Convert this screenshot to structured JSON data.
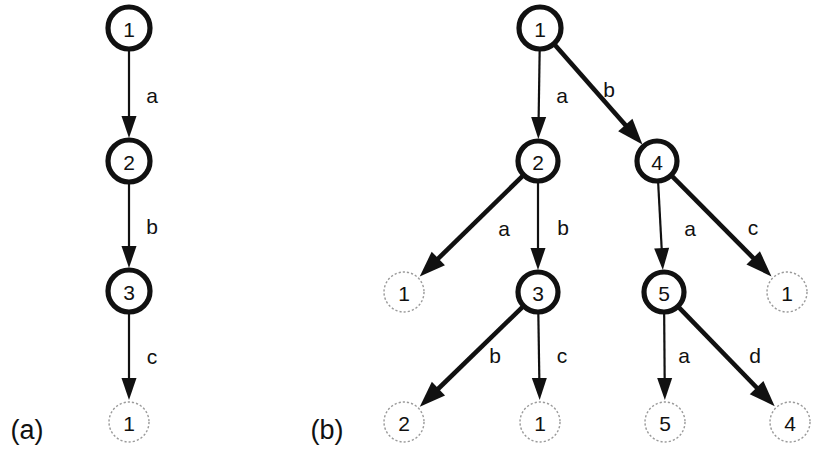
{
  "figure": {
    "width": 833,
    "height": 452,
    "background": "#ffffff",
    "stroke_color": "#111111",
    "dotted_node_color": "#9a9a9a"
  },
  "panels": [
    {
      "id": "a",
      "caption": "(a)",
      "caption_x": 27,
      "caption_y": 430,
      "nodes": [
        {
          "id": "a-n1",
          "label": "1",
          "x": 129,
          "y": 28,
          "r": 21,
          "style": "solid"
        },
        {
          "id": "a-n2",
          "label": "2",
          "x": 129,
          "y": 161,
          "r": 21,
          "style": "solid"
        },
        {
          "id": "a-n3",
          "label": "3",
          "x": 129,
          "y": 291,
          "r": 21,
          "style": "solid"
        },
        {
          "id": "a-n4",
          "label": "1",
          "x": 129,
          "y": 422,
          "r": 20,
          "style": "dotted"
        }
      ],
      "edges": [
        {
          "id": "a-e1",
          "from": "a-n1",
          "to": "a-n2",
          "label": "a",
          "label_x": 152,
          "label_y": 95,
          "weight": "thin"
        },
        {
          "id": "a-e2",
          "from": "a-n2",
          "to": "a-n3",
          "label": "b",
          "label_x": 152,
          "label_y": 226,
          "weight": "thin"
        },
        {
          "id": "a-e3",
          "from": "a-n3",
          "to": "a-n4",
          "label": "c",
          "label_x": 152,
          "label_y": 356,
          "weight": "thin"
        }
      ]
    },
    {
      "id": "b",
      "caption": "(b)",
      "caption_x": 327,
      "caption_y": 430,
      "nodes": [
        {
          "id": "b-n1",
          "label": "1",
          "x": 540,
          "y": 28,
          "r": 21,
          "style": "solid"
        },
        {
          "id": "b-n2",
          "label": "2",
          "x": 538,
          "y": 161,
          "r": 20,
          "style": "solid"
        },
        {
          "id": "b-n4",
          "label": "4",
          "x": 657,
          "y": 161,
          "r": 20,
          "style": "solid"
        },
        {
          "id": "b-l1",
          "label": "1",
          "x": 404,
          "y": 292,
          "r": 20,
          "style": "dotted"
        },
        {
          "id": "b-n3",
          "label": "3",
          "x": 538,
          "y": 292,
          "r": 20,
          "style": "solid"
        },
        {
          "id": "b-n5",
          "label": "5",
          "x": 664,
          "y": 292,
          "r": 20,
          "style": "solid"
        },
        {
          "id": "b-l2",
          "label": "1",
          "x": 787,
          "y": 292,
          "r": 20,
          "style": "dotted"
        },
        {
          "id": "b-l3",
          "label": "2",
          "x": 404,
          "y": 422,
          "r": 20,
          "style": "dotted"
        },
        {
          "id": "b-l4",
          "label": "1",
          "x": 540,
          "y": 422,
          "r": 20,
          "style": "dotted"
        },
        {
          "id": "b-l5",
          "label": "5",
          "x": 665,
          "y": 422,
          "r": 20,
          "style": "dotted"
        },
        {
          "id": "b-l6",
          "label": "4",
          "x": 790,
          "y": 422,
          "r": 20,
          "style": "dotted"
        }
      ],
      "edges": [
        {
          "id": "b-e1",
          "from": "b-n1",
          "to": "b-n2",
          "label": "a",
          "label_x": 562,
          "label_y": 95,
          "weight": "thin"
        },
        {
          "id": "b-e2",
          "from": "b-n1",
          "to": "b-n4",
          "label": "b",
          "label_x": 609,
          "label_y": 89,
          "weight": "thick"
        },
        {
          "id": "b-e3",
          "from": "b-n2",
          "to": "b-l1",
          "label": "a",
          "label_x": 504,
          "label_y": 228,
          "weight": "thick"
        },
        {
          "id": "b-e4",
          "from": "b-n2",
          "to": "b-n3",
          "label": "b",
          "label_x": 563,
          "label_y": 227,
          "weight": "thin"
        },
        {
          "id": "b-e5",
          "from": "b-n4",
          "to": "b-n5",
          "label": "a",
          "label_x": 690,
          "label_y": 228,
          "weight": "thin"
        },
        {
          "id": "b-e6",
          "from": "b-n4",
          "to": "b-l2",
          "label": "c",
          "label_x": 753,
          "label_y": 227,
          "weight": "thick"
        },
        {
          "id": "b-e7",
          "from": "b-n3",
          "to": "b-l3",
          "label": "b",
          "label_x": 495,
          "label_y": 355,
          "weight": "thick"
        },
        {
          "id": "b-e8",
          "from": "b-n3",
          "to": "b-l4",
          "label": "c",
          "label_x": 562,
          "label_y": 355,
          "weight": "thin"
        },
        {
          "id": "b-e9",
          "from": "b-n5",
          "to": "b-l5",
          "label": "a",
          "label_x": 684,
          "label_y": 355,
          "weight": "thin"
        },
        {
          "id": "b-e10",
          "from": "b-n5",
          "to": "b-l6",
          "label": "d",
          "label_x": 755,
          "label_y": 355,
          "weight": "thick"
        }
      ]
    }
  ]
}
